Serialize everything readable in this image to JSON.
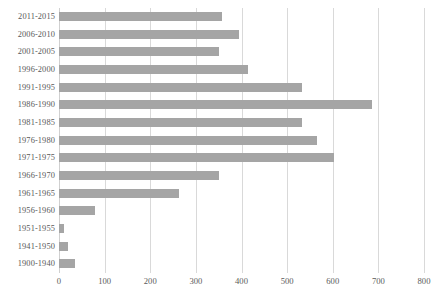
{
  "chart_data": {
    "type": "bar",
    "orientation": "horizontal",
    "title": "",
    "subtitle": "",
    "xlabel": "",
    "ylabel": "",
    "xlim": [
      0,
      800
    ],
    "xticks": [
      0,
      100,
      200,
      300,
      400,
      500,
      600,
      700,
      800
    ],
    "xtick_labels": [
      "0",
      "100",
      "200",
      "300",
      "400",
      "500",
      "600",
      "700",
      "800"
    ],
    "grid": "vertical",
    "legend": "none",
    "series_color": "#a5a5a5",
    "categories": [
      "2011-2015",
      "2006-2010",
      "2001-2005",
      "1996-2000",
      "1991-1995",
      "1986-1990",
      "1981-1985",
      "1976-1980",
      "1971-1975",
      "1966-1970",
      "1961-1965",
      "1956-1960",
      "1951-1955",
      "1941-1950",
      "1900-1940"
    ],
    "values": [
      358,
      394,
      350,
      415,
      532,
      686,
      532,
      565,
      602,
      350,
      264,
      79,
      11,
      20,
      34
    ]
  }
}
